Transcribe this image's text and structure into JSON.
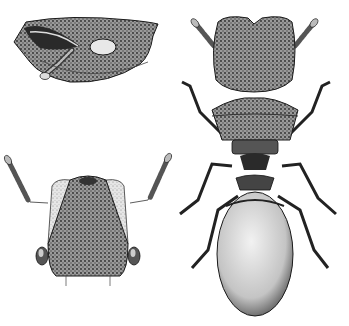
{
  "figure": {
    "panels": [
      {
        "id": "head-lateral",
        "label": "Head, lateral view",
        "position": "top-left"
      },
      {
        "id": "head-frontal",
        "label": "Head, frontal view",
        "position": "bottom-left"
      },
      {
        "id": "body-dorsal",
        "label": "Whole body, dorsal view",
        "position": "right"
      }
    ],
    "colors": {
      "background": "#ffffff",
      "ink": "#1a1a1a",
      "shade_dark": "#3a3a3a",
      "shade_mid": "#7a7a7a",
      "shade_light": "#c8c8c8",
      "highlight": "#eeeeee"
    }
  }
}
